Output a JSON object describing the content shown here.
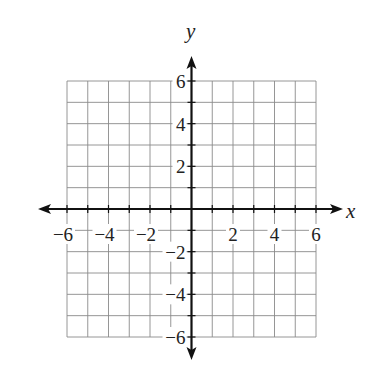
{
  "chart_data": {
    "type": "scatter",
    "title": "",
    "xlabel": "x",
    "ylabel": "y",
    "xlim": [
      -6,
      6
    ],
    "ylim": [
      -6,
      6
    ],
    "grid": true,
    "grid_step": 1,
    "x_ticks": [
      -6,
      -4,
      -2,
      2,
      4,
      6
    ],
    "y_ticks": [
      6,
      4,
      2,
      -2,
      -4,
      -6
    ],
    "x_tick_labels": [
      "−6",
      "−4",
      "−2",
      "2",
      "4",
      "6"
    ],
    "y_tick_labels": [
      "6",
      "4",
      "2",
      "−2",
      "−4",
      "−6"
    ],
    "series": [],
    "axes_arrows": true,
    "legend": null
  },
  "labels": {
    "x_axis": "x",
    "y_axis": "y"
  },
  "colors": {
    "grid": "#8a8a8a",
    "axis": "#111111",
    "text": "#222222"
  }
}
